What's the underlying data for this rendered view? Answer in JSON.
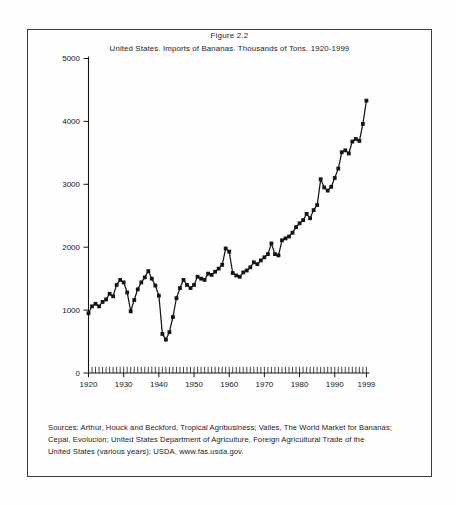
{
  "figure": {
    "label": "Figure 2.2",
    "title": "United States. Imports of Bananas. Thousands of Tons. 1920-1999"
  },
  "sources": {
    "lines": [
      "Sources: Arthur, Houck and Beckford, Tropical Agribusiness; Valles, The World Market for Bananas;",
      "Cepal, Evolucion; United States Department of Agriculture, Foreign Agricultural Trade of the",
      "United States (various years); USDA, www.fas.usda.gov."
    ]
  },
  "chart_data": {
    "type": "line",
    "title": "United States. Imports of Bananas. Thousands of Tons. 1920-1999",
    "figure_label": "Figure 2.2",
    "xlabel": "",
    "ylabel": "",
    "units": "Thousands of Tons",
    "marker": "square",
    "line_color": "#151515",
    "grid": false,
    "legend": "none",
    "xlim": [
      1920,
      1999
    ],
    "ylim": [
      0,
      5000
    ],
    "ytick_interval": 1000,
    "ytick_labels": [
      "0",
      "1000",
      "2000",
      "3000",
      "4000",
      "5000"
    ],
    "xtick_labels": [
      "1920",
      "1930",
      "1940",
      "1950",
      "1960",
      "1970",
      "1980",
      "1990",
      "1999"
    ],
    "x": [
      1920,
      1921,
      1922,
      1923,
      1924,
      1925,
      1926,
      1927,
      1928,
      1929,
      1930,
      1931,
      1932,
      1933,
      1934,
      1935,
      1936,
      1937,
      1938,
      1939,
      1940,
      1941,
      1942,
      1943,
      1944,
      1945,
      1946,
      1947,
      1948,
      1949,
      1950,
      1951,
      1952,
      1953,
      1954,
      1955,
      1956,
      1957,
      1958,
      1959,
      1960,
      1961,
      1962,
      1963,
      1964,
      1965,
      1966,
      1967,
      1968,
      1969,
      1970,
      1971,
      1972,
      1973,
      1974,
      1975,
      1976,
      1977,
      1978,
      1979,
      1980,
      1981,
      1982,
      1983,
      1984,
      1985,
      1986,
      1987,
      1988,
      1989,
      1990,
      1991,
      1992,
      1993,
      1994,
      1995,
      1996,
      1997,
      1998,
      1999
    ],
    "values": [
      950,
      1060,
      1100,
      1060,
      1130,
      1170,
      1260,
      1220,
      1400,
      1480,
      1440,
      1280,
      980,
      1160,
      1330,
      1440,
      1520,
      1620,
      1500,
      1390,
      1230,
      620,
      530,
      650,
      890,
      1190,
      1350,
      1480,
      1400,
      1350,
      1400,
      1530,
      1500,
      1480,
      1580,
      1560,
      1610,
      1660,
      1720,
      1980,
      1930,
      1590,
      1550,
      1530,
      1600,
      1630,
      1680,
      1760,
      1730,
      1790,
      1840,
      1890,
      2060,
      1890,
      1870,
      2110,
      2140,
      2170,
      2230,
      2320,
      2380,
      2430,
      2530,
      2460,
      2590,
      2670,
      3080,
      2950,
      2900,
      2960,
      3100,
      3250,
      3510,
      3540,
      3490,
      3680,
      3720,
      3690,
      3960,
      4330
    ]
  }
}
